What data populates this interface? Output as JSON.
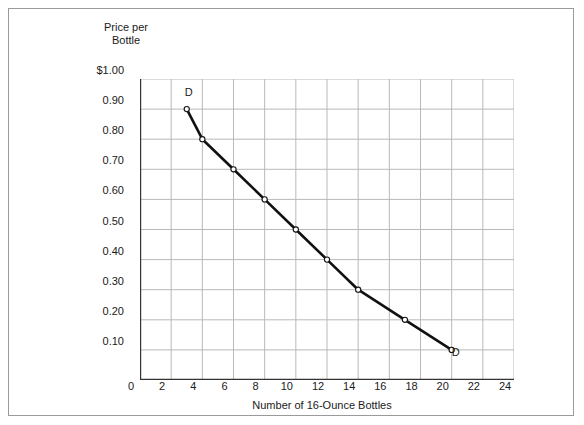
{
  "chart_data": {
    "type": "line",
    "title": "",
    "xlabel": "Number of 16-Ounce Bottles",
    "ylabel": "Price per\nBottle",
    "xlim": [
      0,
      24
    ],
    "ylim": [
      0,
      1.0
    ],
    "grid": true,
    "legend": "none",
    "xticks": [
      0,
      2,
      4,
      6,
      8,
      10,
      12,
      14,
      16,
      18,
      20,
      22,
      24
    ],
    "xtick_labels": [
      "0",
      "2",
      "4",
      "6",
      "8",
      "10",
      "12",
      "14",
      "16",
      "18",
      "20",
      "22",
      "24"
    ],
    "yticks": [
      0.1,
      0.2,
      0.3,
      0.4,
      0.5,
      0.6,
      0.7,
      0.8,
      0.9,
      1.0
    ],
    "ytick_labels": [
      "0.10",
      "0.20",
      "0.30",
      "0.40",
      "0.50",
      "0.60",
      "0.70",
      "0.80",
      "0.90",
      "$1.00"
    ],
    "series": [
      {
        "name": "D",
        "marker": "open-circle",
        "x": [
          3,
          4,
          6,
          8,
          10,
          12,
          14,
          17,
          20
        ],
        "y": [
          0.9,
          0.8,
          0.7,
          0.6,
          0.5,
          0.4,
          0.3,
          0.2,
          0.1
        ]
      }
    ],
    "annotations": [
      {
        "text": "D",
        "x": 3,
        "y": 0.9,
        "position": "above-right"
      },
      {
        "text": "D",
        "x": 20,
        "y": 0.1,
        "position": "below-right"
      }
    ],
    "colors": {
      "curve": "#111111",
      "grid": "#b9b9b9",
      "axis": "#333333",
      "marker_fill": "#ffffff",
      "border": "#9a9a9a",
      "background": "#ffffff"
    }
  }
}
